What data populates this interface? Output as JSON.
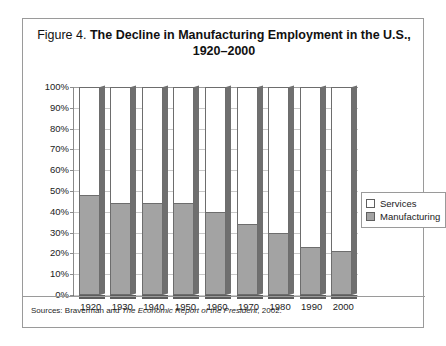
{
  "figure": {
    "number_label": "Figure 4.",
    "caption_line1": "The Decline in Manufacturing Employment in the U.S.,",
    "caption_line2": "1920–2000",
    "source_prefix": "Sources: Braverman and ",
    "source_italic": "The Economic Report of the President",
    "source_suffix": ", 2002."
  },
  "legend": {
    "services_label": "Services",
    "manufacturing_label": "Manufacturing"
  },
  "colors": {
    "manufacturing": "#a3a3a3",
    "services": "#ffffff",
    "bar_outline": "#6d6d6d",
    "gridline": "#c9c9c9",
    "frame": "#9a9a9a"
  },
  "chart_data": {
    "type": "bar",
    "subtype": "stacked-100-percent",
    "title": "Figure 4. The Decline in Manufacturing Employment in the U.S., 1920–2000",
    "xlabel": "",
    "ylabel": "",
    "ylim": [
      0,
      100
    ],
    "ytick_labels": [
      "100%",
      "90%",
      "80%",
      "70%",
      "60%",
      "50%",
      "40%",
      "30%",
      "20%",
      "10%",
      "0%"
    ],
    "ytick_values": [
      100,
      90,
      80,
      70,
      60,
      50,
      40,
      30,
      20,
      10,
      0
    ],
    "grid": true,
    "legend_position": "right",
    "categories": [
      "1920",
      "1930",
      "1940",
      "1950",
      "1960",
      "1970",
      "1980",
      "1990",
      "2000"
    ],
    "series": [
      {
        "name": "Manufacturing",
        "values": [
          48,
          44,
          44,
          44,
          40,
          34,
          30,
          23,
          21
        ]
      },
      {
        "name": "Services",
        "values": [
          52,
          56,
          56,
          56,
          60,
          66,
          70,
          77,
          79
        ]
      }
    ]
  }
}
